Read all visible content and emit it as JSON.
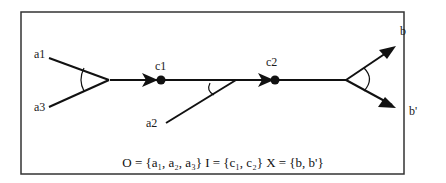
{
  "diagram": {
    "labels": {
      "a1": "a1",
      "a3": "a3",
      "a2": "a2",
      "c1": "c1",
      "c2": "c2",
      "b": "b",
      "b_prime": "b'"
    },
    "caption": "O = {a₁, a₂, a₃} I = {c₁, c₂} X = {b, b'}",
    "colors": {
      "stroke": "#111111",
      "frame": "#333333",
      "background": "#ffffff"
    }
  }
}
